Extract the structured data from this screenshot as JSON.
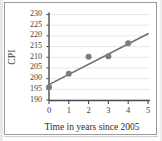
{
  "figure": {
    "kind": "scatter-plot-with-trend-line",
    "background_color": "#ffffff",
    "frame_color": "#9b9b9b"
  },
  "chart_data": {
    "type": "scatter",
    "title": "",
    "xlabel": "Time in years since 2005",
    "ylabel": "CPI",
    "xlim": [
      0,
      5
    ],
    "ylim": [
      190,
      230
    ],
    "xticks": [
      0,
      1,
      2,
      3,
      4,
      5
    ],
    "yticks": [
      190,
      195,
      200,
      205,
      210,
      215,
      220,
      225,
      230
    ],
    "xtick_labels": [
      "0",
      "1",
      "2",
      "3",
      "4",
      "5"
    ],
    "ytick_labels": [
      "190",
      "195",
      "200",
      "205",
      "210",
      "215",
      "220",
      "225",
      "230"
    ],
    "grid": "horizontal",
    "grid_color": "#e2e2e2",
    "axis_color": "#4a4a4a",
    "legend": null,
    "marker_color": "#7d7d7d",
    "marker_size": 4.2,
    "line_color": "#6f6f6f",
    "line_width": 1.6,
    "points": [
      {
        "x": 0,
        "y": 196.0
      },
      {
        "x": 1,
        "y": 202.3
      },
      {
        "x": 2,
        "y": 210.2
      },
      {
        "x": 3,
        "y": 210.5
      },
      {
        "x": 4,
        "y": 216.5
      }
    ],
    "series": [
      {
        "name": "CPI observations",
        "x": [
          0,
          1,
          2,
          3,
          4
        ],
        "values": [
          196.0,
          202.3,
          210.2,
          210.5,
          216.5
        ]
      }
    ],
    "trend_line": {
      "name": "line of best fit",
      "x": [
        0,
        5
      ],
      "values": [
        197.2,
        221.0
      ]
    },
    "annotations": []
  },
  "axis": {
    "y_title": "CPI",
    "x_title": "Time in years since 2005"
  }
}
